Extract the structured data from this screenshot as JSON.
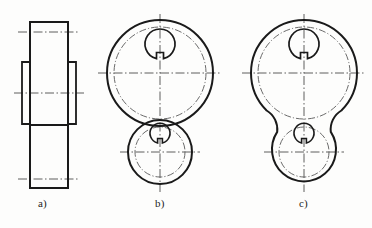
{
  "figure": {
    "background_color": "#fdfdfc",
    "line_color": "#1a1a1a",
    "centerline_color": "#4d4d4d",
    "captions": [
      {
        "id": "a",
        "label": "a)",
        "x": 38,
        "y": 197
      },
      {
        "id": "b",
        "label": "b)",
        "x": 155,
        "y": 197
      },
      {
        "id": "c",
        "label": "c)",
        "x": 299,
        "y": 197
      }
    ],
    "views": [
      {
        "id": "a",
        "name": "side-elevation-view",
        "description": "Rectangular side elevation of the two-boss lever with stepped hub outlines",
        "outline": {
          "x": 30,
          "y": 22,
          "width": 38,
          "height": 166
        },
        "hub_flanges": [
          {
            "side": "left",
            "x": 22,
            "y": 62,
            "width": 8,
            "height": 62
          },
          {
            "side": "right",
            "x": 68,
            "y": 62,
            "width": 8,
            "height": 62
          }
        ],
        "step_line_y": 125,
        "centerlines": [
          {
            "orientation": "horizontal",
            "y": 32,
            "x1": 18,
            "x2": 80
          },
          {
            "orientation": "horizontal",
            "y": 93,
            "x1": 14,
            "x2": 84
          },
          {
            "orientation": "horizontal",
            "y": 179,
            "x1": 18,
            "x2": 80
          }
        ]
      },
      {
        "id": "b",
        "name": "end-view-intersecting-bosses",
        "description": "Two overlapping circular bosses whose outlines cross; construction arcs remain visible at the intersection",
        "large_boss": {
          "cx": 160,
          "cy": 73,
          "outer_r": 53,
          "pitch_r": 46,
          "bore_r": 15,
          "keyway_width": 7,
          "keyway_height": 8
        },
        "small_boss": {
          "cx": 160,
          "cy": 152,
          "outer_r": 32,
          "pitch_r": 25,
          "bore_r": 10,
          "keyway_width": 5,
          "keyway_height": 6
        },
        "blend": "intersecting",
        "centerlines": [
          {
            "orientation": "vertical",
            "x": 160,
            "y1": 14,
            "y2": 192
          },
          {
            "orientation": "horizontal",
            "y": 73,
            "x1": 98,
            "x2": 222
          },
          {
            "orientation": "horizontal",
            "y": 152,
            "x1": 120,
            "x2": 200
          }
        ]
      },
      {
        "id": "c",
        "name": "end-view-filleted-bosses",
        "description": "Same two circular bosses joined by concave tangent fillets forming a continuous outline",
        "large_boss": {
          "cx": 304,
          "cy": 73,
          "outer_r": 53,
          "pitch_r": 46,
          "bore_r": 15,
          "keyway_width": 7,
          "keyway_height": 8
        },
        "small_boss": {
          "cx": 304,
          "cy": 152,
          "outer_r": 32,
          "pitch_r": 25,
          "bore_r": 10,
          "keyway_width": 5,
          "keyway_height": 6
        },
        "blend": "tangent-fillet",
        "fillet_radius": 22,
        "centerlines": [
          {
            "orientation": "vertical",
            "x": 304,
            "y1": 14,
            "y2": 192
          },
          {
            "orientation": "horizontal",
            "y": 73,
            "x1": 242,
            "x2": 366
          },
          {
            "orientation": "horizontal",
            "y": 152,
            "x1": 264,
            "x2": 344
          }
        ]
      }
    ]
  }
}
